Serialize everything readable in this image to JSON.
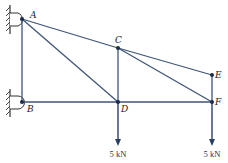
{
  "diagram": {
    "type": "truss",
    "colors": {
      "member": "#3f5576",
      "node": "#1a2a4a",
      "support": "#333333",
      "load": "#2a3f66"
    },
    "nodes": [
      {
        "id": "A",
        "label": "A",
        "x": 22,
        "y": 19
      },
      {
        "id": "B",
        "label": "B",
        "x": 22,
        "y": 102
      },
      {
        "id": "C",
        "label": "C",
        "x": 118,
        "y": 48
      },
      {
        "id": "D",
        "label": "D",
        "x": 118,
        "y": 102
      },
      {
        "id": "E",
        "label": "E",
        "x": 212,
        "y": 75
      },
      {
        "id": "F",
        "label": "F",
        "x": 212,
        "y": 102
      }
    ],
    "members": [
      "AB",
      "AC",
      "AD",
      "BD",
      "CD",
      "CE",
      "CF",
      "DF",
      "EF"
    ],
    "supports": [
      {
        "node": "A",
        "type": "pin-wall"
      },
      {
        "node": "B",
        "type": "pin-wall"
      }
    ],
    "loads": [
      {
        "node": "D",
        "label": "5 kN",
        "direction": "down"
      },
      {
        "node": "F",
        "label": "5 kN",
        "direction": "down"
      }
    ]
  }
}
